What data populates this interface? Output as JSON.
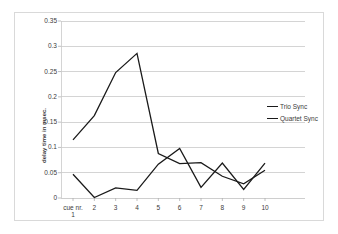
{
  "chart_data": {
    "type": "line",
    "title": "",
    "xlabel": "cue nr.",
    "ylabel": "delay time in msec.",
    "categories": [
      "1",
      "2",
      "3",
      "4",
      "5",
      "6",
      "7",
      "8",
      "9",
      "10"
    ],
    "x_first_tick_prefix": "cue nr.",
    "ylim": [
      0,
      0.35
    ],
    "yticks": [
      "0",
      "0.05",
      "0.1",
      "0.15",
      "0.2",
      "0.25",
      "0.3",
      "0.35"
    ],
    "ytick_values": [
      0,
      0.05,
      0.1,
      0.15,
      0.2,
      0.25,
      0.3,
      0.35
    ],
    "grid": true,
    "grid_color": "#c9c9c9",
    "legend_position": "right",
    "line_color": "#1a1a1a",
    "series": [
      {
        "name": "Trio Sync",
        "values": [
          0.115,
          0.163,
          0.248,
          0.286,
          0.088,
          0.068,
          0.07,
          0.043,
          0.028,
          0.055
        ]
      },
      {
        "name": "Quartet Sync",
        "values": [
          0.047,
          0.001,
          0.02,
          0.015,
          0.067,
          0.098,
          0.021,
          0.069,
          0.017,
          0.069
        ]
      }
    ]
  },
  "legend": {
    "items": [
      {
        "label": "Trio Sync"
      },
      {
        "label": "Quartet Sync"
      }
    ]
  },
  "axes": {
    "y_title": "delay time in msec."
  }
}
